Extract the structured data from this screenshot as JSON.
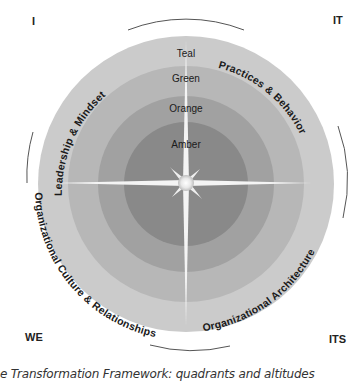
{
  "corners": {
    "top_left": "I",
    "top_right": "IT",
    "bottom_left": "WE",
    "bottom_right": "ITS"
  },
  "quadrants": {
    "upper_left": "Leadership & Mindset",
    "upper_right": "Practices & Behavior",
    "lower_left": "Organizational Culture & Relationships",
    "lower_right": "Organizational Architecture"
  },
  "altitudes": [
    {
      "label": "Teal",
      "color": "#c9c9c9"
    },
    {
      "label": "Green",
      "color": "#b5b5b5"
    },
    {
      "label": "Orange",
      "color": "#9f9f9f"
    },
    {
      "label": "Amber",
      "color": "#878787"
    }
  ],
  "caption": "e Transformation Framework: quadrants and altitudes"
}
